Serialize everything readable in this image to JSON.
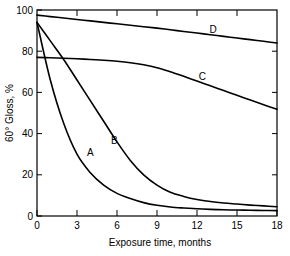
{
  "chart_data": {
    "type": "line",
    "title": "",
    "subtitle": "",
    "xlabel": "Exposure time, months",
    "ylabel": "60° Gloss, %",
    "xlim": [
      0,
      18
    ],
    "ylim": [
      0,
      100
    ],
    "xticks": [
      0,
      3,
      6,
      9,
      12,
      15,
      18
    ],
    "xtick_labels": [
      "0",
      "3",
      "6",
      "9",
      "12",
      "15",
      "18"
    ],
    "yticks": [
      0,
      20,
      40,
      60,
      80,
      100
    ],
    "ytick_labels": [
      "0",
      "20",
      "40",
      "60",
      "80",
      "100"
    ],
    "grid": false,
    "legend_position": "inline-curve-labels",
    "x": [
      0,
      1,
      2,
      3,
      4,
      5,
      6,
      7,
      8,
      9,
      10,
      11,
      12,
      13,
      14,
      15,
      16,
      17,
      18
    ],
    "series": [
      {
        "name": "A",
        "label": "A",
        "label_x": 4.0,
        "label_y": 29,
        "color": "#000000",
        "values": [
          94,
          66,
          45,
          30,
          21,
          15,
          11,
          8.5,
          6.5,
          5.2,
          4.4,
          3.9,
          3.5,
          3.2,
          3.0,
          2.9,
          2.8,
          2.7,
          2.6
        ]
      },
      {
        "name": "B",
        "label": "B",
        "label_x": 5.8,
        "label_y": 35,
        "color": "#000000",
        "values": [
          94,
          85,
          76,
          66,
          56,
          46,
          36,
          27,
          20,
          15,
          11.5,
          9.5,
          8.0,
          7.0,
          6.3,
          5.8,
          5.3,
          4.9,
          4.5
        ]
      },
      {
        "name": "C",
        "label": "C",
        "label_x": 12.4,
        "label_y": 66,
        "color": "#000000",
        "values": [
          77,
          76.8,
          76.6,
          76.3,
          76.0,
          75.6,
          75.1,
          74.4,
          73.4,
          72.0,
          70.0,
          67.8,
          65.5,
          63.2,
          60.9,
          58.6,
          56.3,
          54.0,
          51.8
        ]
      },
      {
        "name": "D",
        "label": "D",
        "label_x": 13.2,
        "label_y": 89,
        "color": "#000000",
        "values": [
          97.5,
          96.8,
          96.1,
          95.4,
          94.7,
          94.0,
          93.3,
          92.6,
          91.9,
          91.2,
          90.4,
          89.6,
          88.8,
          88.0,
          87.2,
          86.4,
          85.6,
          84.8,
          84.0
        ]
      }
    ]
  },
  "axes": {
    "y_axis_label": "60° Gloss, %",
    "x_axis_label": "Exposure time, months"
  }
}
